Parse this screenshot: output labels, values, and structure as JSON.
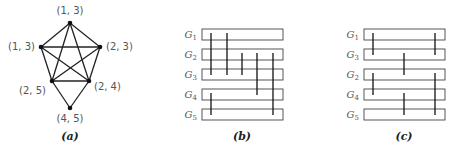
{
  "panels": {
    "a": {
      "caption": "(a)",
      "nodes": [
        {
          "id": "n1",
          "label": "(1, 3)",
          "x": 70,
          "y": 23,
          "lx": 70,
          "ly": 14,
          "anchor": "middle"
        },
        {
          "id": "n2",
          "label": "(1, 3)",
          "x": 41,
          "y": 47,
          "lx": 35,
          "ly": 50,
          "anchor": "end"
        },
        {
          "id": "n3",
          "label": "(2, 3)",
          "x": 100,
          "y": 47,
          "lx": 106,
          "ly": 50,
          "anchor": "start"
        },
        {
          "id": "n4",
          "label": "(2, 5)",
          "x": 52,
          "y": 81,
          "lx": 46,
          "ly": 94,
          "anchor": "end"
        },
        {
          "id": "n5",
          "label": "(2, 4)",
          "x": 89,
          "y": 81,
          "lx": 94,
          "ly": 90,
          "anchor": "start"
        },
        {
          "id": "n6",
          "label": "(4, 5)",
          "x": 70,
          "y": 108,
          "lx": 70,
          "ly": 122,
          "anchor": "middle"
        }
      ],
      "edges": [
        [
          "n1",
          "n2"
        ],
        [
          "n1",
          "n3"
        ],
        [
          "n1",
          "n4"
        ],
        [
          "n1",
          "n5"
        ],
        [
          "n2",
          "n3"
        ],
        [
          "n2",
          "n4"
        ],
        [
          "n2",
          "n5"
        ],
        [
          "n3",
          "n4"
        ],
        [
          "n3",
          "n5"
        ],
        [
          "n4",
          "n5"
        ],
        [
          "n4",
          "n6"
        ],
        [
          "n5",
          "n6"
        ]
      ]
    },
    "b": {
      "caption": "(b)",
      "rect_x": 202,
      "rect_w": 81,
      "rect_h": 11,
      "rows": [
        {
          "name": "G",
          "sub": "1",
          "y": 29
        },
        {
          "name": "G",
          "sub": "2",
          "y": 49
        },
        {
          "name": "G",
          "sub": "3",
          "y": 69
        },
        {
          "name": "G",
          "sub": "4",
          "y": 89
        },
        {
          "name": "G",
          "sub": "5",
          "y": 109
        }
      ],
      "lines": [
        {
          "x": 211,
          "y1": 33,
          "y2": 75
        },
        {
          "x": 227,
          "y1": 33,
          "y2": 75
        },
        {
          "x": 242,
          "y1": 53,
          "y2": 75
        },
        {
          "x": 257,
          "y1": 53,
          "y2": 95
        },
        {
          "x": 273,
          "y1": 53,
          "y2": 115
        },
        {
          "x": 211,
          "y1": 93,
          "y2": 115
        }
      ]
    },
    "c": {
      "caption": "(c)",
      "rect_x": 364,
      "rect_w": 81,
      "rect_h": 11,
      "rows": [
        {
          "name": "G",
          "sub": "1",
          "y": 29
        },
        {
          "name": "G",
          "sub": "3",
          "y": 49
        },
        {
          "name": "G",
          "sub": "2",
          "y": 69
        },
        {
          "name": "G",
          "sub": "4",
          "y": 89
        },
        {
          "name": "G",
          "sub": "5",
          "y": 109
        }
      ],
      "lines": [
        {
          "x": 373,
          "y1": 33,
          "y2": 55
        },
        {
          "x": 435,
          "y1": 33,
          "y2": 55
        },
        {
          "x": 404,
          "y1": 53,
          "y2": 75
        },
        {
          "x": 373,
          "y1": 73,
          "y2": 95
        },
        {
          "x": 435,
          "y1": 73,
          "y2": 115
        },
        {
          "x": 404,
          "y1": 93,
          "y2": 115
        }
      ]
    }
  }
}
